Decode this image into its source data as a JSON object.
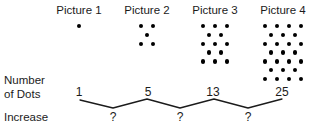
{
  "diagram": {
    "pictures": [
      {
        "label": "Picture 1",
        "dots": 1,
        "rows": [
          1
        ]
      },
      {
        "label": "Picture 2",
        "dots": 5,
        "rows": [
          2,
          1,
          2
        ]
      },
      {
        "label": "Picture 3",
        "dots": 13,
        "rows": [
          3,
          2,
          3,
          2,
          3
        ]
      },
      {
        "label": "Picture 4",
        "dots": 25,
        "rows": [
          4,
          3,
          4,
          3,
          4,
          3,
          4
        ]
      }
    ],
    "row_labels": {
      "number_of_dots_line1": "Number",
      "number_of_dots_line2": "of Dots",
      "increase": "Increase"
    },
    "counts": [
      "1",
      "5",
      "13",
      "25"
    ],
    "increases": [
      "?",
      "?",
      "?"
    ],
    "colors": {
      "dot": "#000000",
      "text": "#1b1b1b",
      "bracket_line": "#1b1b1b",
      "background": "#ffffff"
    }
  }
}
